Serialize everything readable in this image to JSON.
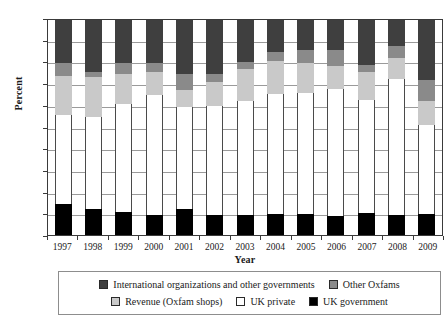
{
  "chart_data": {
    "type": "bar",
    "subtype": "stacked-bar-100-percent",
    "title": "",
    "xlabel": "Year",
    "ylabel": "Percent",
    "ylim": [
      0,
      100
    ],
    "yticks": [
      0,
      10,
      20,
      30,
      40,
      50,
      60,
      70,
      80,
      90,
      100
    ],
    "ytick_labels": [
      "0",
      "10",
      "20",
      "30",
      "40",
      "50",
      "60",
      "70",
      "80",
      "90",
      "100"
    ],
    "grid": true,
    "legend_position": "bottom",
    "categories": [
      "1997",
      "1998",
      "1999",
      "2000",
      "2001",
      "2002",
      "2003",
      "2004",
      "2005",
      "2006",
      "2007",
      "2008",
      "2009"
    ],
    "series": [
      {
        "name": "UK government",
        "color": "#000000",
        "values": [
          14.5,
          12.0,
          10.7,
          9.4,
          12.2,
          9.5,
          9.2,
          10.0,
          10.0,
          8.8,
          10.2,
          9.2,
          9.8
        ]
      },
      {
        "name": "UK private",
        "color": "#ffffff",
        "values": [
          41.5,
          43.0,
          50.3,
          55.6,
          47.3,
          50.5,
          53.3,
          55.8,
          56.2,
          59.0,
          52.8,
          63.5,
          41.4
        ]
      },
      {
        "name": "Revenue (Oxfam shops)",
        "color": "#c9c9c9",
        "values": [
          18.0,
          18.5,
          14.0,
          11.0,
          8.0,
          11.0,
          14.5,
          15.0,
          14.0,
          11.0,
          13.0,
          9.8,
          11.0
        ]
      },
      {
        "name": "Other Oxfams",
        "color": "#8a8a8a",
        "values": [
          6.0,
          2.5,
          5.0,
          4.0,
          7.5,
          4.0,
          3.5,
          4.2,
          5.8,
          7.2,
          3.0,
          5.5,
          10.0
        ]
      },
      {
        "name": "International organizations and other governments",
        "color": "#3f3f3f",
        "values": [
          20.0,
          24.0,
          20.0,
          20.0,
          25.0,
          25.0,
          19.5,
          15.0,
          14.0,
          14.0,
          21.0,
          12.0,
          27.8
        ]
      }
    ]
  },
  "axes": {
    "y_title": "Percent",
    "x_title": "Year"
  },
  "legend": {
    "rows": [
      [
        {
          "label": "International organizations and other governments",
          "color": "#3f3f3f",
          "swatch_name": "legend-swatch-international-organizations"
        },
        {
          "label": "Other Oxfams",
          "color": "#8a8a8a",
          "swatch_name": "legend-swatch-other-oxfams"
        }
      ],
      [
        {
          "label": "Revenue (Oxfam shops)",
          "color": "#c9c9c9",
          "swatch_name": "legend-swatch-revenue-oxfam-shops"
        },
        {
          "label": "UK private",
          "color": "#ffffff",
          "swatch_name": "legend-swatch-uk-private"
        },
        {
          "label": "UK government",
          "color": "#000000",
          "swatch_name": "legend-swatch-uk-government"
        }
      ]
    ]
  },
  "colors": {
    "axis": "#3a3a3a",
    "grid": "#9a9a9a",
    "background": "#ffffff"
  }
}
